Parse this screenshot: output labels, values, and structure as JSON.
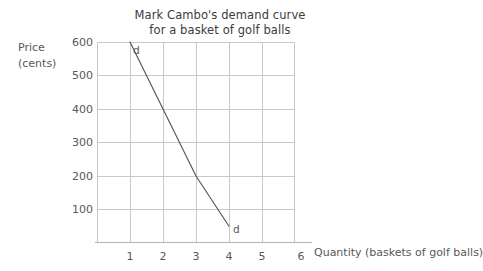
{
  "chart_data": {
    "type": "line",
    "title": "Mark Cambo's demand curve\nfor a basket of golf balls",
    "xlabel": "Quantity (baskets of golf balls)",
    "ylabel": "Price\n(cents)",
    "ylabel_main": "Price",
    "ylabel_unit": "(cents)",
    "xlim": [
      0,
      6
    ],
    "ylim": [
      0,
      600
    ],
    "grid": true,
    "legend": "none",
    "x_ticks": [
      "1",
      "2",
      "3",
      "4",
      "5",
      "6"
    ],
    "x_tick_values": [
      1,
      2,
      3,
      4,
      5,
      6
    ],
    "y_ticks": [
      "100",
      "200",
      "300",
      "400",
      "500",
      "600"
    ],
    "y_tick_values": [
      100,
      200,
      300,
      400,
      500,
      600
    ],
    "series": [
      {
        "name": "d",
        "label_start": "d",
        "label_end": "d",
        "points": [
          {
            "x": 1,
            "y": 600
          },
          {
            "x": 2,
            "y": 400
          },
          {
            "x": 3,
            "y": 200
          },
          {
            "x": 4,
            "y": 50
          }
        ]
      }
    ],
    "annotations": [
      {
        "name": "d-top",
        "text": "d",
        "x": 1.15,
        "y": 585
      },
      {
        "name": "d-bottom",
        "text": "d",
        "x": 4.15,
        "y": 45
      }
    ],
    "colors": {
      "curve": "#55555a",
      "grid": "#c9c9cb",
      "axis": "#b4b4b6",
      "text": "#58585a",
      "title": "#3b3b3d",
      "background": "#ffffff"
    }
  }
}
